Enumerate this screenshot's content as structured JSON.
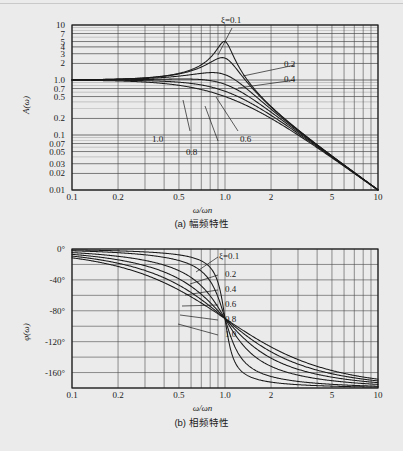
{
  "figure": {
    "background_color": "#ebebeb",
    "line_color": "#1a1a1a",
    "grid_color": "#4a4a4a"
  },
  "panel_a": {
    "caption": "(a) 幅频特性",
    "y_axis_title": "A(ω)",
    "x_axis_title": "ω/ωn",
    "y_tick_labels": [
      "10",
      "7",
      "5",
      "4",
      "3",
      "2",
      "1.0",
      "0.7",
      "0.5",
      "0.2",
      "0.1",
      "0.07",
      "0.05",
      "0.03",
      "0.02",
      "0.01"
    ],
    "y_tick_values": [
      10,
      7,
      5,
      4,
      3,
      2,
      1.0,
      0.7,
      0.5,
      0.2,
      0.1,
      0.07,
      0.05,
      0.03,
      0.02,
      0.01
    ],
    "x_tick_labels": [
      "0.1",
      "0.2",
      "0.5",
      "1.0",
      "2",
      "5",
      "10"
    ],
    "x_tick_values": [
      0.1,
      0.2,
      0.5,
      1.0,
      2,
      5,
      10
    ],
    "curve_labels": [
      {
        "text": "ξ=0.1",
        "zeta": 0.1
      },
      {
        "text": "0.2",
        "zeta": 0.2
      },
      {
        "text": "0.4",
        "zeta": 0.4
      },
      {
        "text": "0.6",
        "zeta": 0.6
      },
      {
        "text": "0.8",
        "zeta": 0.8
      },
      {
        "text": "1.0",
        "zeta": 1.0
      }
    ]
  },
  "panel_b": {
    "caption": "(b) 相频特性",
    "y_axis_title": "φ(ω)",
    "x_axis_title": "ω/ωn",
    "y_tick_labels": [
      "0°",
      "-40°",
      "-80°",
      "-120°",
      "-160°"
    ],
    "y_tick_values": [
      0,
      -40,
      -80,
      -120,
      -160
    ],
    "x_tick_labels": [
      "0.1",
      "0.2",
      "0.5",
      "1.0",
      "2",
      "5",
      "10"
    ],
    "x_tick_values": [
      0.1,
      0.2,
      0.5,
      1.0,
      2,
      5,
      10
    ],
    "curve_labels": [
      {
        "text": "ξ=0.1",
        "zeta": 0.1
      },
      {
        "text": "0.2",
        "zeta": 0.2
      },
      {
        "text": "0.4",
        "zeta": 0.4
      },
      {
        "text": "0.6",
        "zeta": 0.6
      },
      {
        "text": "0.8",
        "zeta": 0.8
      },
      {
        "text": "1.0",
        "zeta": 1.0
      }
    ]
  },
  "chart_data": [
    {
      "type": "line",
      "id": "amplitude-frequency",
      "title": "(a) 幅频特性",
      "xlabel": "ω/ωn",
      "ylabel": "A(ω)",
      "xscale": "log",
      "yscale": "log",
      "xlim": [
        0.1,
        10
      ],
      "ylim": [
        0.01,
        10
      ],
      "grid": true,
      "legend": "inline-annotations",
      "xticks": [
        0.1,
        0.2,
        0.5,
        1.0,
        2,
        5,
        10
      ],
      "yticks": [
        0.01,
        0.02,
        0.03,
        0.05,
        0.07,
        0.1,
        0.2,
        0.5,
        0.7,
        1.0,
        2,
        3,
        4,
        5,
        7,
        10
      ],
      "x": [
        0.1,
        0.15,
        0.2,
        0.3,
        0.4,
        0.5,
        0.6,
        0.7,
        0.8,
        0.9,
        0.95,
        1.0,
        1.05,
        1.1,
        1.2,
        1.4,
        1.6,
        2.0,
        3.0,
        4.0,
        5.0,
        7.0,
        10.0
      ],
      "series": [
        {
          "name": "ξ=0.1",
          "zeta": 0.1,
          "values": [
            1.01,
            1.023,
            1.042,
            1.099,
            1.19,
            1.331,
            1.558,
            1.955,
            2.756,
            4.525,
            5.602,
            5.0,
            3.92,
            2.567,
            1.496,
            0.675,
            0.395,
            0.196,
            0.08,
            0.044,
            0.028,
            0.014,
            0.007
          ],
          "peak": {
            "x": 0.99,
            "y": 5.02
          }
        },
        {
          "name": "0.2",
          "zeta": 0.2,
          "values": [
            1.01,
            1.022,
            1.04,
            1.094,
            1.178,
            1.302,
            1.488,
            1.767,
            2.153,
            2.513,
            2.569,
            2.5,
            2.358,
            2.15,
            1.72,
            1.04,
            0.69,
            0.37,
            0.127,
            0.068,
            0.042,
            0.021,
            0.01
          ],
          "peak": {
            "x": 0.96,
            "y": 2.55
          }
        },
        {
          "name": "0.4",
          "zeta": 0.4,
          "values": [
            1.009,
            1.02,
            1.036,
            1.081,
            1.145,
            1.231,
            1.332,
            1.42,
            1.447,
            1.383,
            1.33,
            1.25,
            1.17,
            1.082,
            0.92,
            0.667,
            0.5,
            0.307,
            0.118,
            0.065,
            0.041,
            0.021,
            0.01
          ],
          "peak": {
            "x": 0.78,
            "y": 1.36
          }
        },
        {
          "name": "0.6",
          "zeta": 0.6,
          "values": [
            1.008,
            1.017,
            1.029,
            1.062,
            1.101,
            1.14,
            1.157,
            1.14,
            1.09,
            1.018,
            0.98,
            0.833,
            0.897,
            0.86,
            0.77,
            0.603,
            0.47,
            0.3,
            0.117,
            0.065,
            0.041,
            0.021,
            0.01
          ],
          "peak": {
            "x": 0.55,
            "y": 1.15
          }
        },
        {
          "name": "0.8",
          "zeta": 0.8,
          "values": [
            1.005,
            1.01,
            1.017,
            1.032,
            1.042,
            1.038,
            1.012,
            0.968,
            0.912,
            0.85,
            0.82,
            0.625,
            0.76,
            0.732,
            0.674,
            0.553,
            0.445,
            0.292,
            0.116,
            0.065,
            0.041,
            0.021,
            0.01
          ],
          "peak": {
            "x": 0.2,
            "y": 1.02
          }
        },
        {
          "name": "1.0",
          "zeta": 1.0,
          "values": [
            0.99,
            0.978,
            0.961,
            0.917,
            0.862,
            0.8,
            0.735,
            0.671,
            0.61,
            0.553,
            0.527,
            0.5,
            0.476,
            0.453,
            0.412,
            0.344,
            0.29,
            0.2,
            0.1,
            0.059,
            0.038,
            0.02,
            0.01
          ],
          "peak": null
        }
      ],
      "annotations": [
        {
          "text": "ξ=0.1",
          "points_to_series": "ξ=0.1"
        },
        {
          "text": "0.2",
          "points_to_series": "0.2"
        },
        {
          "text": "0.4",
          "points_to_series": "0.4"
        },
        {
          "text": "0.6",
          "points_to_series": "0.6"
        },
        {
          "text": "0.8",
          "points_to_series": "0.8"
        },
        {
          "text": "1.0",
          "points_to_series": "1.0"
        }
      ]
    },
    {
      "type": "line",
      "id": "phase-frequency",
      "title": "(b) 相频特性",
      "xlabel": "ω/ωn",
      "ylabel": "φ(ω)",
      "xscale": "log",
      "yscale": "linear",
      "xlim": [
        0.1,
        10
      ],
      "ylim": [
        -180,
        0
      ],
      "grid": true,
      "legend": "inline-annotations",
      "xticks": [
        0.1,
        0.2,
        0.5,
        1.0,
        2,
        5,
        10
      ],
      "yticks": [
        0,
        -40,
        -80,
        -120,
        -160
      ],
      "x": [
        0.1,
        0.15,
        0.2,
        0.3,
        0.4,
        0.5,
        0.6,
        0.7,
        0.8,
        0.9,
        1.0,
        1.1,
        1.2,
        1.4,
        1.6,
        2.0,
        3.0,
        4.0,
        5.0,
        7.0,
        10.0
      ],
      "units": "degrees",
      "series": [
        {
          "name": "ξ=0.1",
          "zeta": 0.1,
          "values": [
            -1.2,
            -1.7,
            -2.4,
            -4.0,
            -5.5,
            -7.6,
            -10.6,
            -15.6,
            -26.6,
            -46.4,
            -90.0,
            -133.6,
            -153.4,
            -166.3,
            -170.6,
            -174.2,
            -177.1,
            -178.1,
            -178.6,
            -179.1,
            -179.4
          ]
        },
        {
          "name": "0.2",
          "zeta": 0.2,
          "values": [
            -2.3,
            -3.5,
            -4.8,
            -7.9,
            -11.0,
            -14.9,
            -20.6,
            -29.6,
            -42.7,
            -65.4,
            -90.0,
            -113.0,
            -130.6,
            -150.0,
            -157.9,
            -165.1,
            -171.1,
            -173.9,
            -175.3,
            -176.9,
            -178.1
          ]
        },
        {
          "name": "0.4",
          "zeta": 0.4,
          "values": [
            -4.6,
            -6.9,
            -9.5,
            -15.4,
            -21.4,
            -28.1,
            -37.5,
            -50.2,
            -65.8,
            -78.6,
            -90.0,
            -100.4,
            -110.2,
            -126.0,
            -136.3,
            -148.0,
            -161.0,
            -166.5,
            -169.4,
            -172.5,
            -175.0
          ]
        },
        {
          "name": "0.6",
          "zeta": 0.6,
          "values": [
            -6.9,
            -10.3,
            -14.2,
            -22.6,
            -31.0,
            -39.7,
            -50.9,
            -64.1,
            -77.3,
            -84.6,
            -90.0,
            -95.8,
            -102.8,
            -117.6,
            -128.5,
            -143.1,
            -156.3,
            -163.0,
            -166.8,
            -170.8,
            -173.9
          ]
        },
        {
          "name": "0.8",
          "zeta": 0.8,
          "values": [
            -9.2,
            -13.7,
            -18.8,
            -29.5,
            -39.6,
            -49.4,
            -60.9,
            -72.6,
            -82.3,
            -86.8,
            -90.0,
            -93.4,
            -97.8,
            -110.0,
            -120.9,
            -138.0,
            -153.3,
            -160.8,
            -165.0,
            -169.5,
            -172.9
          ]
        },
        {
          "name": "1.0",
          "zeta": 1.0,
          "values": [
            -11.4,
            -17.1,
            -23.6,
            -36.3,
            -47.7,
            -58.1,
            -69.4,
            -79.0,
            -85.4,
            -88.4,
            -90.0,
            -92.0,
            -94.6,
            -105.5,
            -116.2,
            -134.0,
            -150.7,
            -158.9,
            -163.4,
            -168.4,
            -172.2
          ]
        }
      ],
      "annotations": [
        {
          "text": "ξ=0.1",
          "points_to_series": "ξ=0.1"
        },
        {
          "text": "0.2",
          "points_to_series": "0.2"
        },
        {
          "text": "0.4",
          "points_to_series": "0.4"
        },
        {
          "text": "0.6",
          "points_to_series": "0.6"
        },
        {
          "text": "0.8",
          "points_to_series": "0.8"
        },
        {
          "text": "1.0",
          "points_to_series": "1.0"
        }
      ]
    }
  ]
}
